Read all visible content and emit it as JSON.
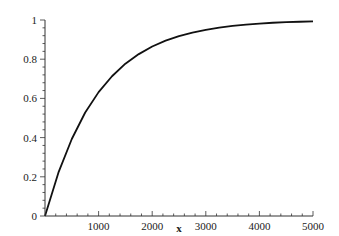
{
  "chart_data": {
    "type": "line",
    "title": "",
    "xlabel": "x",
    "ylabel": "",
    "xlim": [
      0,
      5000
    ],
    "ylim": [
      0,
      1
    ],
    "x_ticks": [
      1000,
      2000,
      3000,
      4000,
      5000
    ],
    "x_tick_labels": [
      "1000",
      "2000",
      "3000",
      "4000",
      "5000"
    ],
    "y_ticks": [
      0,
      0.2,
      0.4,
      0.6,
      0.8,
      1
    ],
    "y_tick_labels": [
      "0",
      "0.2",
      "0.4",
      "0.6",
      "0.8",
      "1"
    ],
    "grid": false,
    "legend": null,
    "series": [
      {
        "name": "1 - exp(-x/1000)",
        "color": "#111111",
        "x": [
          0,
          250,
          500,
          750,
          1000,
          1250,
          1500,
          1750,
          2000,
          2250,
          2500,
          2750,
          3000,
          3250,
          3500,
          3750,
          4000,
          4250,
          4500,
          4750,
          5000
        ],
        "values": [
          0,
          0.221,
          0.393,
          0.528,
          0.632,
          0.713,
          0.777,
          0.826,
          0.865,
          0.895,
          0.918,
          0.936,
          0.95,
          0.961,
          0.97,
          0.976,
          0.982,
          0.986,
          0.989,
          0.991,
          0.993
        ]
      }
    ]
  }
}
